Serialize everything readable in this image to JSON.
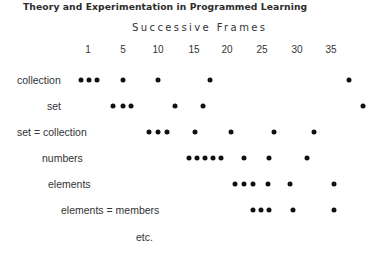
{
  "title": "Theory and Experimentation in Programmed Learning",
  "chart_data": {
    "type": "scatter",
    "title": "Successive Frames",
    "xlabel": "Successive Frames",
    "ylabel": "",
    "x_ticks": [
      {
        "label": "1",
        "x": 88
      },
      {
        "label": "5",
        "x": 123
      },
      {
        "label": "10",
        "x": 158
      },
      {
        "label": "15",
        "x": 194
      },
      {
        "label": "20",
        "x": 227
      },
      {
        "label": "25",
        "x": 262
      },
      {
        "label": "30",
        "x": 297
      },
      {
        "label": "35",
        "x": 331
      }
    ],
    "series": [
      {
        "name": "collection",
        "label_x": 17,
        "y": 80,
        "frames": [
          1,
          2,
          3,
          7,
          12,
          19,
          39
        ],
        "dots_x": [
          81,
          89,
          97,
          123,
          158,
          210,
          349
        ]
      },
      {
        "name": "set",
        "label_x": 47,
        "y": 106,
        "frames": [
          5,
          7,
          8,
          14,
          18,
          41
        ],
        "dots_x": [
          113,
          123,
          131,
          175,
          203,
          363
        ]
      },
      {
        "name": "set = collection",
        "label_x": 17,
        "y": 132,
        "frames": [
          11,
          12,
          13,
          17,
          22,
          28,
          33
        ],
        "dots_x": [
          149,
          158,
          167,
          195,
          231,
          274,
          314
        ]
      },
      {
        "name": "numbers",
        "label_x": 42,
        "y": 158,
        "frames": [
          16,
          17,
          18,
          19,
          20,
          24,
          27,
          32
        ],
        "dots_x": [
          189,
          197,
          205,
          213,
          221,
          244,
          269,
          307
        ]
      },
      {
        "name": "elements",
        "label_x": 48,
        "y": 184,
        "frames": [
          23,
          24,
          25,
          27,
          30,
          36
        ],
        "dots_x": [
          235,
          244,
          253,
          268,
          290,
          334
        ]
      },
      {
        "name": "elements = members",
        "label_x": 61,
        "y": 210,
        "frames": [
          25,
          26,
          27,
          30,
          36
        ],
        "dots_x": [
          253,
          261,
          269,
          293,
          334
        ]
      },
      {
        "name": "etc.",
        "label_x": 136,
        "y": 237,
        "frames": [],
        "dots_x": []
      }
    ],
    "grid": false,
    "legend": "none"
  }
}
